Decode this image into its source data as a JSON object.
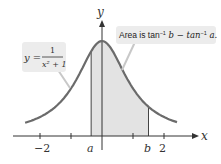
{
  "axes": {
    "x_label": "x",
    "y_label": "y",
    "x_ticks": [
      -2,
      -1,
      1,
      2
    ],
    "x_tick_labels": [
      "−2",
      "2"
    ]
  },
  "curve": {
    "equation_lhs": "y =",
    "numerator": "1",
    "denominator": "x² + 1",
    "color": "#6b6b6b"
  },
  "shaded_region": {
    "from_label": "a",
    "to_label": "b",
    "a": -0.35,
    "b": 1.5,
    "fill": "#e3e3e3"
  },
  "callouts": {
    "equation_box": {
      "text": "y = 1/(x²+1)"
    },
    "area_box": {
      "prefix": "Area is tan",
      "sup1": "−1",
      "mid": " b − tan",
      "sup2": "−1",
      "suffix": " a."
    }
  },
  "chart_data": {
    "type": "line",
    "title": "",
    "xlabel": "x",
    "ylabel": "y",
    "function": "y = 1/(x^2+1)",
    "x": [
      -2.5,
      -2,
      -1.5,
      -1,
      -0.5,
      0,
      0.5,
      1,
      1.5,
      2,
      2.5
    ],
    "values": [
      0.138,
      0.2,
      0.308,
      0.5,
      0.8,
      1.0,
      0.8,
      0.5,
      0.308,
      0.2,
      0.138
    ],
    "shaded_interval": {
      "a": "a",
      "b": "b"
    },
    "annotations": [
      "y = 1/(x²+1)",
      "Area is tan⁻¹ b − tan⁻¹ a."
    ],
    "xlim": [
      -3.2,
      3.3
    ],
    "ylim": [
      0,
      1.1
    ],
    "grid": false
  }
}
